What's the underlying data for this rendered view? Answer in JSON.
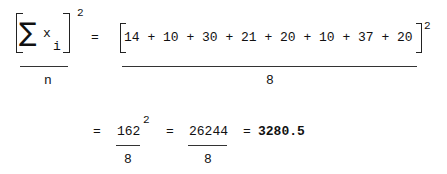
{
  "formula": {
    "lhs": {
      "symbol": "∑",
      "variable": "x",
      "subscript": "i",
      "exponent": "2",
      "denominator": "n"
    },
    "step1": {
      "equals": "=",
      "terms": [
        "14",
        "10",
        "30",
        "21",
        "20",
        "10",
        "37",
        "20"
      ],
      "expression": "14 + 10 + 30 + 21 + 20 + 10 + 37 + 20",
      "exponent": "2",
      "denominator": "8"
    },
    "step2": {
      "equals": "=",
      "numerator": "162",
      "exponent": "2",
      "denominator": "8"
    },
    "step3": {
      "equals": "=",
      "numerator": "26244",
      "denominator": "8"
    },
    "result": {
      "equals": "=",
      "value": "3280.5"
    }
  }
}
